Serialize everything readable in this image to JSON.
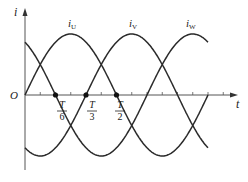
{
  "diagram": {
    "axes": {
      "y_label": "i",
      "x_label": "t",
      "origin_label": "O"
    },
    "curves": [
      {
        "name": "i_U",
        "label_main": "i",
        "label_sub": "U",
        "phase_deg": 0
      },
      {
        "name": "i_V",
        "label_main": "i",
        "label_sub": "V",
        "phase_deg": -120
      },
      {
        "name": "i_W",
        "label_main": "i",
        "label_sub": "W",
        "phase_deg": 120
      }
    ],
    "marked_points": [
      {
        "num": "T",
        "den": "6"
      },
      {
        "num": "T",
        "den": "3"
      },
      {
        "num": "T",
        "den": "2"
      }
    ],
    "colors": {
      "line": "#2a2a2a",
      "axis": "#555555"
    }
  },
  "chart_data": {
    "type": "line",
    "title": "",
    "xlabel": "t",
    "ylabel": "i",
    "x_ticks": [
      "T/6",
      "T/3",
      "T/2"
    ],
    "x_range": [
      "0",
      "T"
    ],
    "series": [
      {
        "name": "i_U",
        "expression": "Im·sin(ωt)"
      },
      {
        "name": "i_V",
        "expression": "Im·sin(ωt − 120°)"
      },
      {
        "name": "i_W",
        "expression": "Im·sin(ωt + 120°)"
      }
    ],
    "zero_crossings_marked": [
      "T/6 (i_W)",
      "T/3 (i_V)",
      "T/2 (i_U)"
    ],
    "grid": false
  }
}
